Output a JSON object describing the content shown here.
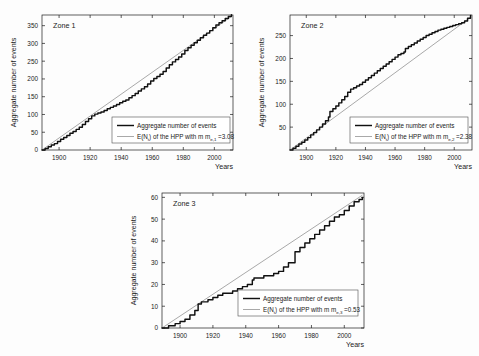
{
  "figure": {
    "background": "#fdfdfd",
    "empirical_color": "#111111",
    "hpp_color": "#8c8c8c",
    "axis_color": "#1a1a1a"
  },
  "common": {
    "ylabel": "Aggregate number of events",
    "xlabel": "Years",
    "legend_empirical": "Aggregate number of events",
    "legend_hpp_prefix": "E(N",
    "legend_hpp_sub_t": "t",
    "legend_hpp_mid": ") of the HPP with m",
    "legend_hpp_eq": "="
  },
  "chart_data": [
    {
      "type": "line",
      "title": "Zone 1",
      "xlabel": "Years",
      "ylabel": "Aggregate number of events",
      "xlim": [
        1889,
        2012
      ],
      "ylim": [
        0,
        380
      ],
      "xticks": [
        1900,
        1920,
        1940,
        1960,
        1980,
        2000
      ],
      "yticks": [
        0,
        50,
        100,
        150,
        200,
        250,
        300,
        350
      ],
      "grid": false,
      "legend_position": "lower-right",
      "annotations": {
        "rate_symbol": "m",
        "rate_subscript": "e,1",
        "rate_value": "3.08"
      },
      "series": [
        {
          "name": "Aggregate number of events",
          "style": "step-solid",
          "x": [
            1889,
            1891,
            1893,
            1895,
            1897,
            1899,
            1901,
            1903,
            1905,
            1907,
            1909,
            1911,
            1913,
            1915,
            1917,
            1919,
            1921,
            1923,
            1925,
            1927,
            1929,
            1931,
            1933,
            1935,
            1937,
            1939,
            1941,
            1943,
            1945,
            1947,
            1949,
            1951,
            1953,
            1955,
            1957,
            1959,
            1961,
            1963,
            1965,
            1967,
            1969,
            1971,
            1973,
            1975,
            1977,
            1979,
            1981,
            1983,
            1985,
            1987,
            1989,
            1991,
            1993,
            1995,
            1997,
            1999,
            2001,
            2003,
            2005,
            2007,
            2009,
            2011
          ],
          "values": [
            0,
            4,
            9,
            14,
            18,
            24,
            30,
            35,
            41,
            47,
            52,
            58,
            64,
            72,
            80,
            88,
            96,
            101,
            104,
            107,
            111,
            116,
            120,
            124,
            128,
            133,
            137,
            141,
            147,
            153,
            159,
            166,
            172,
            178,
            186,
            194,
            201,
            207,
            213,
            221,
            231,
            240,
            248,
            255,
            262,
            270,
            280,
            288,
            295,
            302,
            309,
            316,
            323,
            329,
            336,
            344,
            352,
            358,
            364,
            370,
            376,
            381
          ]
        },
        {
          "name": "E(Nt) of the HPP",
          "style": "line-thin",
          "x": [
            1889,
            2011
          ],
          "values": [
            0,
            376
          ]
        }
      ]
    },
    {
      "type": "line",
      "title": "Zone 2",
      "xlabel": "Years",
      "ylabel": "Aggregate number of events",
      "xlim": [
        1889,
        2012
      ],
      "ylim": [
        0,
        295
      ],
      "xticks": [
        1900,
        1920,
        1940,
        1960,
        1980,
        2000
      ],
      "yticks": [
        50,
        100,
        150,
        200,
        250
      ],
      "grid": false,
      "legend_position": "lower-right",
      "annotations": {
        "rate_symbol": "m",
        "rate_subscript": "e,2",
        "rate_value": "2.38"
      },
      "series": [
        {
          "name": "Aggregate number of events",
          "style": "step-solid",
          "x": [
            1889,
            1891,
            1893,
            1895,
            1897,
            1899,
            1901,
            1903,
            1905,
            1907,
            1909,
            1911,
            1913,
            1915,
            1916,
            1918,
            1920,
            1922,
            1924,
            1926,
            1928,
            1930,
            1932,
            1934,
            1936,
            1938,
            1940,
            1942,
            1944,
            1946,
            1948,
            1950,
            1952,
            1954,
            1956,
            1958,
            1960,
            1962,
            1964,
            1966,
            1967,
            1969,
            1971,
            1973,
            1975,
            1977,
            1979,
            1981,
            1983,
            1985,
            1987,
            1989,
            1991,
            1993,
            1995,
            1997,
            1999,
            2001,
            2003,
            2005,
            2007,
            2009,
            2011
          ],
          "values": [
            0,
            4,
            8,
            13,
            17,
            22,
            27,
            33,
            38,
            44,
            50,
            57,
            64,
            72,
            84,
            90,
            96,
            103,
            110,
            117,
            126,
            133,
            136,
            140,
            143,
            148,
            153,
            158,
            163,
            168,
            173,
            178,
            183,
            188,
            193,
            198,
            203,
            208,
            211,
            214,
            222,
            226,
            230,
            234,
            238,
            242,
            246,
            250,
            253,
            256,
            259,
            262,
            264,
            266,
            268,
            270,
            272,
            274,
            276,
            278,
            282,
            288,
            294
          ]
        },
        {
          "name": "E(Nt) of the HPP",
          "style": "line-thin",
          "x": [
            1889,
            2011
          ],
          "values": [
            0,
            290
          ]
        }
      ]
    },
    {
      "type": "line",
      "title": "Zone 3",
      "xlabel": "Years",
      "ylabel": "Aggregate number of events",
      "xlim": [
        1889,
        2012
      ],
      "ylim": [
        0,
        62
      ],
      "xticks": [
        1900,
        1920,
        1940,
        1960,
        1980,
        2000
      ],
      "yticks": [
        0,
        10,
        20,
        30,
        40,
        50,
        60
      ],
      "grid": false,
      "legend_position": "lower-right",
      "annotations": {
        "rate_symbol": "m",
        "rate_subscript": "e,3",
        "rate_value": "0.53"
      },
      "series": [
        {
          "name": "Aggregate number of events",
          "style": "step-solid",
          "x": [
            1889,
            1893,
            1897,
            1900,
            1903,
            1906,
            1909,
            1911,
            1913,
            1915,
            1917,
            1920,
            1923,
            1926,
            1929,
            1932,
            1935,
            1938,
            1941,
            1944,
            1945,
            1948,
            1951,
            1954,
            1957,
            1960,
            1963,
            1966,
            1967,
            1970,
            1973,
            1976,
            1979,
            1982,
            1985,
            1988,
            1991,
            1994,
            1997,
            2000,
            2003,
            2006,
            2009,
            2011
          ],
          "values": [
            0,
            1,
            2,
            3,
            4,
            6,
            8,
            11,
            12,
            12,
            13,
            14,
            15,
            16,
            16,
            17,
            18,
            19,
            20,
            22,
            23,
            23,
            24,
            24,
            25,
            26,
            28,
            30,
            30,
            35,
            37,
            39,
            41,
            43,
            45,
            47,
            49,
            51,
            52,
            54,
            56,
            58,
            59,
            60
          ]
        },
        {
          "name": "E(Nt) of the HPP",
          "style": "line-thin",
          "x": [
            1889,
            2011
          ],
          "values": [
            0,
            61
          ]
        }
      ]
    }
  ]
}
